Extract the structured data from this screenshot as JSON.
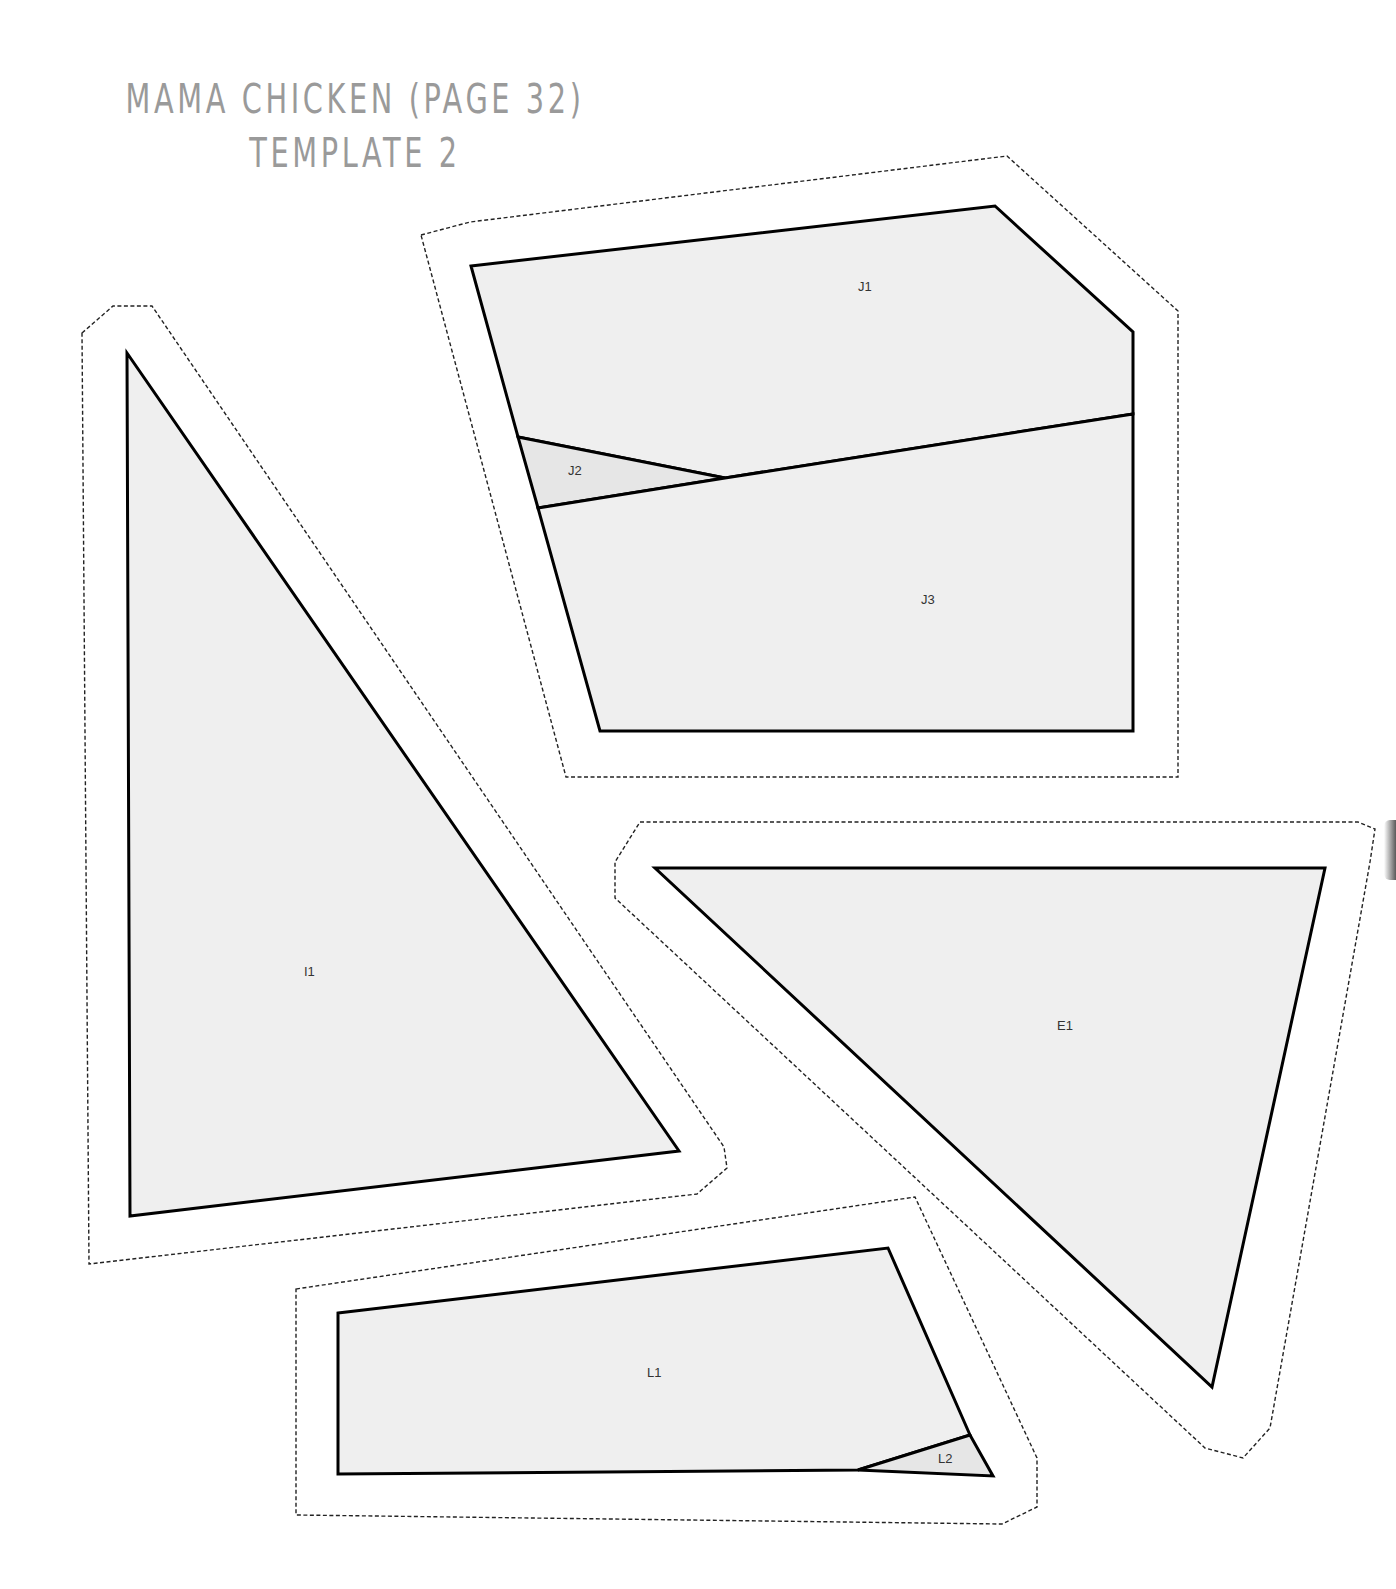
{
  "header": {
    "title_line1": "MAMA CHICKEN (PAGE 32)",
    "title_line2": "TEMPLATE 2"
  },
  "pieces": {
    "I": {
      "labels": {
        "I1": "I1"
      }
    },
    "J": {
      "labels": {
        "J1": "J1",
        "J2": "J2",
        "J3": "J3"
      }
    },
    "E": {
      "labels": {
        "E1": "E1"
      }
    },
    "L": {
      "labels": {
        "L1": "L1",
        "L2": "L2"
      }
    }
  },
  "legend": {
    "seam_allowance": "dashed outline",
    "sewing_line": "solid outline"
  }
}
